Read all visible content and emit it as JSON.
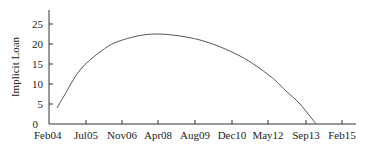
{
  "chart_data": {
    "type": "line",
    "title": "",
    "xlabel": "",
    "ylabel": "Implicit Loan",
    "ylim": [
      0,
      28
    ],
    "yticks": [
      0,
      5,
      10,
      15,
      20,
      25
    ],
    "xtick_labels": [
      "Feb04",
      "Jul05",
      "Nov06",
      "Apr08",
      "Aug09",
      "Dec10",
      "May12",
      "Sep13",
      "Feb15"
    ],
    "grid": false,
    "legend": null,
    "series": [
      {
        "name": "Implicit Loan",
        "color": "#555555",
        "points": [
          {
            "x": "Apr04",
            "y": 4.0
          },
          {
            "x": "Sep04",
            "y": 7.0
          },
          {
            "x": "Jun05",
            "y": 13.5
          },
          {
            "x": "Apr06",
            "y": 18.0
          },
          {
            "x": "Feb07",
            "y": 20.8
          },
          {
            "x": "Mar08",
            "y": 22.5
          },
          {
            "x": "May09",
            "y": 21.0
          },
          {
            "x": "Jun10",
            "y": 17.0
          },
          {
            "x": "May11",
            "y": 12.0
          },
          {
            "x": "Jun12",
            "y": 8.5
          },
          {
            "x": "May13",
            "y": 5.0
          },
          {
            "x": "Oct13",
            "y": 0.0
          }
        ]
      }
    ]
  },
  "layout": {
    "axis_color": "#333333",
    "line_color": "#555555"
  }
}
